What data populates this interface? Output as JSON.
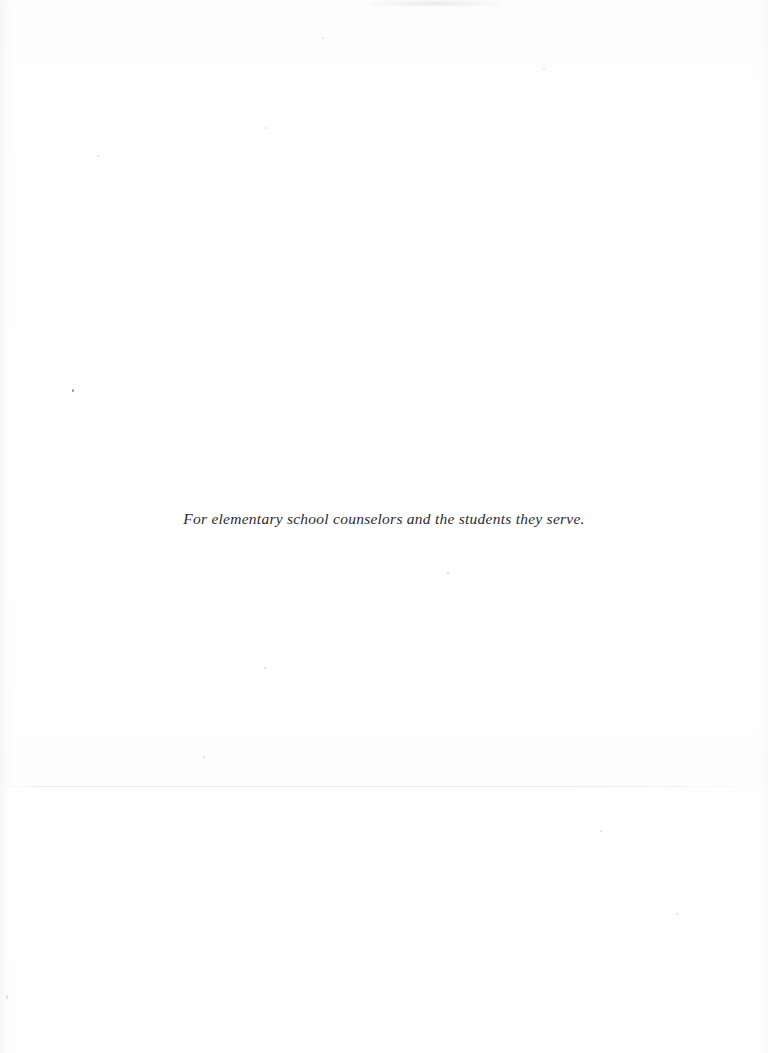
{
  "page": {
    "kind": "book-dedication-page",
    "width": 768,
    "height": 1053,
    "background_color": "#fefefe",
    "text_color": "#2b2b2f"
  },
  "dedication": {
    "text": "For elementary school counselors and the students they serve."
  },
  "artifacts": {
    "scan_seam_color": "#e2e2e8",
    "smudge_color": "#d8d8de",
    "speck_color": "#8e8e93"
  }
}
